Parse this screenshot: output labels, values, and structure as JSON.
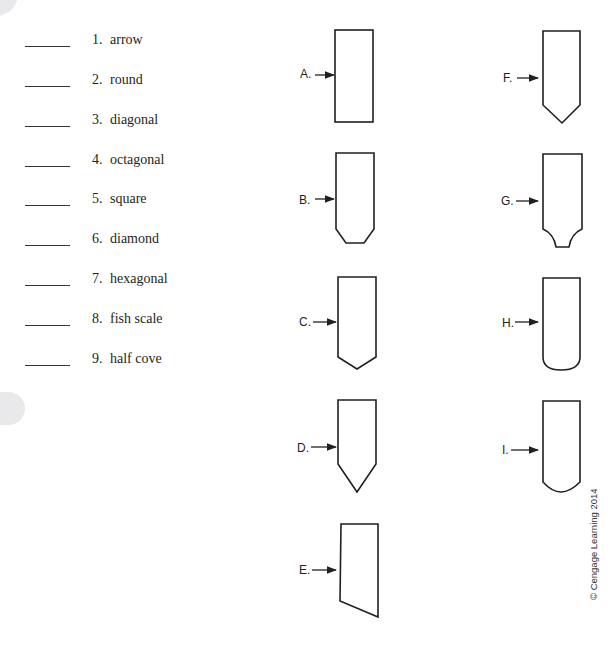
{
  "terms": [
    {
      "number": "1.",
      "label": "arrow",
      "answer": ""
    },
    {
      "number": "2.",
      "label": "round",
      "answer": ""
    },
    {
      "number": "3.",
      "label": "diagonal",
      "answer": ""
    },
    {
      "number": "4.",
      "label": "octagonal",
      "answer": ""
    },
    {
      "number": "5.",
      "label": "square",
      "answer": ""
    },
    {
      "number": "6.",
      "label": "diamond",
      "answer": ""
    },
    {
      "number": "7.",
      "label": "hexagonal",
      "answer": ""
    },
    {
      "number": "8.",
      "label": "fish scale",
      "answer": ""
    },
    {
      "number": "9.",
      "label": "half cove",
      "answer": ""
    }
  ],
  "figures": [
    {
      "letter": "A.",
      "shape": "square-end"
    },
    {
      "letter": "B.",
      "shape": "octagonal-end"
    },
    {
      "letter": "C.",
      "shape": "diamond-end"
    },
    {
      "letter": "D.",
      "shape": "arrow-end"
    },
    {
      "letter": "E.",
      "shape": "diagonal-end"
    },
    {
      "letter": "F.",
      "shape": "hexagonal-end"
    },
    {
      "letter": "G.",
      "shape": "half-cove-end"
    },
    {
      "letter": "H.",
      "shape": "round-end"
    },
    {
      "letter": "I.",
      "shape": "fish-scale-end"
    }
  ],
  "credit": "© Cengage Learning 2014"
}
